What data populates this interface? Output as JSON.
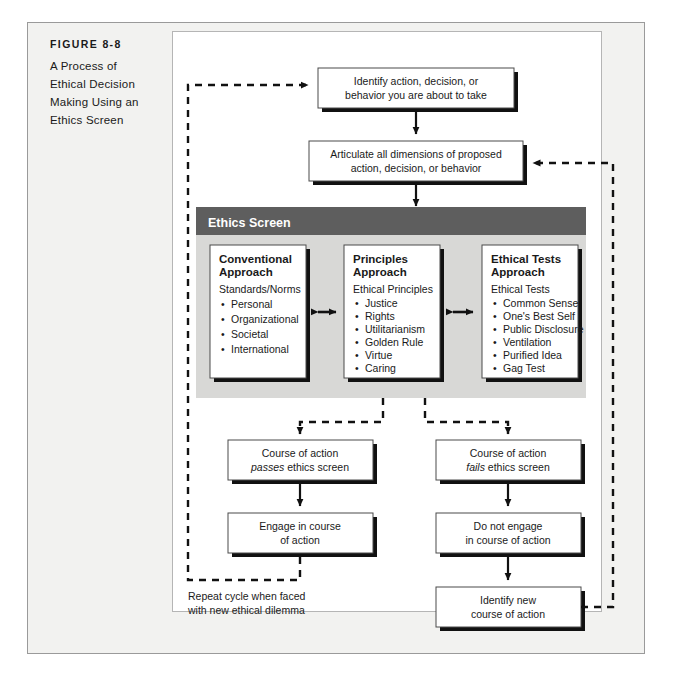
{
  "figure": {
    "number": "FIGURE 8-8",
    "title_lines": [
      "A Process of",
      "Ethical Decision",
      "Making Using an",
      "Ethics Screen"
    ]
  },
  "colors": {
    "page_background": "#ffffff",
    "frame_background": "#f2f2f0",
    "frame_border": "#9a9a9a",
    "plate_background": "#ffffff",
    "screen_header_band": "#5e5e5e",
    "screen_body": "#d8d8d6",
    "box_fill": "#ffffff",
    "box_border": "#4a4a4a",
    "shadow": "#111111",
    "line": "#111111",
    "text": "#1a1a1a",
    "screen_title_text": "#ffffff"
  },
  "flow": {
    "step_identify": {
      "lines": [
        "Identify action, decision, or",
        "behavior you are about to take"
      ]
    },
    "step_articulate": {
      "lines": [
        "Articulate all dimensions of proposed",
        "action, decision, or behavior"
      ]
    },
    "pass_branch": {
      "line1": "Course of action",
      "line2_italic": "passes",
      "line2_rest": "ethics screen"
    },
    "fail_branch": {
      "line1": "Course of action",
      "line2_italic": "fails",
      "line2_rest": "ethics screen"
    },
    "engage": {
      "lines": [
        "Engage in course",
        "of action"
      ]
    },
    "do_not_engage": {
      "lines": [
        "Do not engage",
        "in course of action"
      ]
    },
    "identify_new": {
      "lines": [
        "Identify new",
        "course of action"
      ]
    },
    "repeat_note": {
      "lines": [
        "Repeat cycle when faced",
        "with new ethical dilemma"
      ]
    }
  },
  "ethics_screen": {
    "title": "Ethics Screen",
    "approaches": [
      {
        "heading_lines": [
          "Conventional",
          "Approach"
        ],
        "subhead": "Standards/Norms",
        "items": [
          "Personal",
          "Organizational",
          "Societal",
          "International"
        ]
      },
      {
        "heading_lines": [
          "Principles",
          "Approach"
        ],
        "subhead": "Ethical Principles",
        "items": [
          "Justice",
          "Rights",
          "Utilitarianism",
          "Golden Rule",
          "Virtue",
          "Caring"
        ]
      },
      {
        "heading_lines": [
          "Ethical Tests",
          "Approach"
        ],
        "subhead": "Ethical Tests",
        "items": [
          "Common Sense",
          "One's Best Self",
          "Public Disclosure",
          "Ventilation",
          "Purified Idea",
          "Gag Test"
        ]
      }
    ]
  }
}
